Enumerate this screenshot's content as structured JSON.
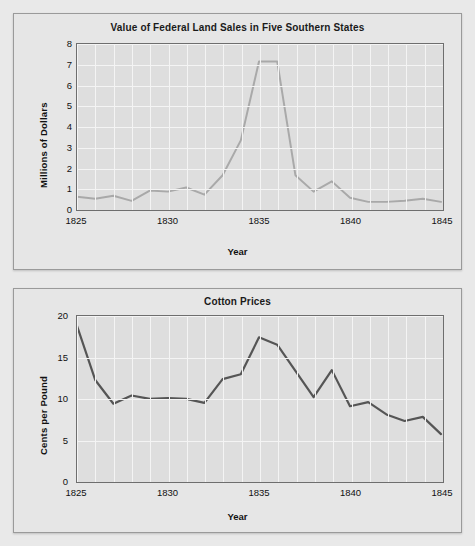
{
  "page": {
    "background": "#e9e9e9",
    "faint_header_text": "",
    "card_background": "#e6e6e6",
    "plot_background": "#dedede",
    "gridline_color": "#f4f4f4",
    "axis_color": "#6e6e6e"
  },
  "charts": [
    {
      "id": "land-sales",
      "title": "Value of Federal Land Sales in Five Southern States",
      "xlabel": "Year",
      "ylabel": "Millions of Dollars",
      "yticks": [
        "0",
        "1",
        "2",
        "3",
        "4",
        "5",
        "6",
        "7",
        "8"
      ],
      "xticks": [
        "1825",
        "1830",
        "1835",
        "1840",
        "1845"
      ],
      "line_color": "#a9a9a9"
    },
    {
      "id": "cotton-prices",
      "title": "Cotton Prices",
      "xlabel": "Year",
      "ylabel": "Cents per Pound",
      "yticks": [
        "0",
        "5",
        "10",
        "15",
        "20"
      ],
      "xticks": [
        "1825",
        "1830",
        "1835",
        "1840",
        "1845"
      ],
      "line_color": "#555555"
    }
  ],
  "chart_data": [
    {
      "type": "line",
      "title": "Value of Federal Land Sales in Five Southern States",
      "xlabel": "Year",
      "ylabel": "Millions of Dollars",
      "xlim": [
        1825,
        1845
      ],
      "ylim": [
        0,
        8
      ],
      "yticks": [
        0,
        1,
        2,
        3,
        4,
        5,
        6,
        7,
        8
      ],
      "xticks": [
        1825,
        1830,
        1835,
        1840,
        1845
      ],
      "grid": true,
      "legend": "none",
      "line_color": "#a9a9a9",
      "x": [
        1825,
        1826,
        1827,
        1828,
        1829,
        1830,
        1831,
        1832,
        1833,
        1834,
        1835,
        1836,
        1837,
        1838,
        1839,
        1840,
        1841,
        1842,
        1843,
        1844,
        1845
      ],
      "values": [
        0.55,
        0.45,
        0.6,
        0.35,
        0.85,
        0.8,
        1.0,
        0.65,
        1.6,
        3.3,
        7.15,
        7.15,
        1.6,
        0.8,
        1.3,
        0.5,
        0.3,
        0.3,
        0.35,
        0.45,
        0.3
      ]
    },
    {
      "type": "line",
      "title": "Cotton Prices",
      "xlabel": "Year",
      "ylabel": "Cents per Pound",
      "xlim": [
        1825,
        1845
      ],
      "ylim": [
        0,
        20
      ],
      "yticks": [
        0,
        5,
        10,
        15,
        20
      ],
      "xticks": [
        1825,
        1830,
        1835,
        1840,
        1845
      ],
      "grid": true,
      "legend": "none",
      "line_color": "#555555",
      "x": [
        1825,
        1826,
        1827,
        1828,
        1829,
        1830,
        1831,
        1832,
        1833,
        1834,
        1835,
        1836,
        1837,
        1838,
        1839,
        1840,
        1841,
        1842,
        1843,
        1844,
        1845
      ],
      "values": [
        18.8,
        12.2,
        9.3,
        10.3,
        9.9,
        10.0,
        9.9,
        9.4,
        12.3,
        12.9,
        17.4,
        16.5,
        13.3,
        10.1,
        13.4,
        9.0,
        9.5,
        8.0,
        7.2,
        7.7,
        5.6
      ]
    }
  ]
}
